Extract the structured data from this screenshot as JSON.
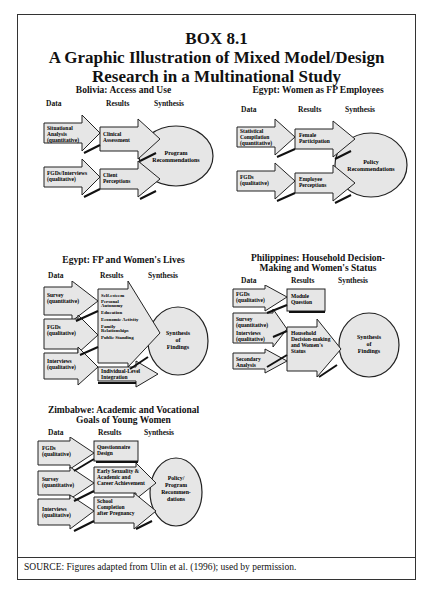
{
  "title": {
    "line1": "BOX 8.1",
    "line2": "A Graphic Illustration of Mixed Model/Design",
    "line3": "Research in a Multinational Study"
  },
  "columns": {
    "data": "Data",
    "results": "Results",
    "synthesis": "Synthesis"
  },
  "panels": [
    {
      "title_lines": [
        "Bolivia: Access and Use"
      ],
      "data": [
        [
          "Situational",
          "Analysis",
          "(quantitative)"
        ],
        [
          "FGDs/Interviews",
          "(qualitative)"
        ]
      ],
      "results": [
        [
          "Clinical",
          "Assessment"
        ],
        [
          "Client",
          "Perceptions"
        ]
      ],
      "synthesis": [
        "Program",
        "Recommendations"
      ]
    },
    {
      "title_lines": [
        "Egypt: Women as FP Employees"
      ],
      "data": [
        [
          "Statistical",
          "Compilation",
          "(quantitative)"
        ],
        [
          "FGDs",
          "(qualitative)"
        ]
      ],
      "results": [
        [
          "Female",
          "Participation"
        ],
        [
          "Employee",
          "Perceptions"
        ]
      ],
      "synthesis": [
        "Policy",
        "Recommendations"
      ]
    },
    {
      "title_lines": [
        "Egypt: FP and Women's Lives"
      ],
      "data": [
        [
          "Survey",
          "(quantitative)"
        ],
        [
          "FGDs",
          "(qualitative)"
        ],
        [
          "Interviews",
          "(qualitative)"
        ]
      ],
      "results": [
        [
          "Self-esteem",
          "Personal",
          "Autonomy",
          "Education",
          "Economic Activity",
          "Family",
          "Relationships",
          "Public Standing"
        ],
        [
          "Individual-Level",
          "Integration"
        ]
      ],
      "synthesis": [
        "Synthesis",
        "of",
        "Findings"
      ]
    },
    {
      "title_lines": [
        "Philippines: Household Decision-",
        "Making and Women's Status"
      ],
      "data": [
        [
          "FGDs",
          "(qualitative)"
        ],
        [
          "Survey",
          "(quantitative)",
          "Interviews",
          "(qualitative)"
        ],
        [
          "Secondary",
          "Analysis"
        ]
      ],
      "results": [
        [
          "Module",
          "Question"
        ],
        [
          "Household",
          "Decision-making",
          "and Women's",
          "Status"
        ]
      ],
      "synthesis": [
        "Synthesis",
        "of",
        "Findings"
      ]
    },
    {
      "title_lines": [
        "Zimbabwe: Academic and Vocational",
        "Goals of Young Women"
      ],
      "data": [
        [
          "FGDs",
          "(qualitative)"
        ],
        [
          "Survey",
          "(quantitative)"
        ],
        [
          "Interviews",
          "(qualitative)"
        ]
      ],
      "results": [
        [
          "Questionnaire",
          "Design"
        ],
        [
          "Early Sexuality &",
          "Academic and",
          "Career Achievement"
        ],
        [
          "School",
          "Completion",
          "after Pregnancy"
        ]
      ],
      "synthesis": [
        "Policy/",
        "Program",
        "Recommen-",
        "dations"
      ]
    }
  ],
  "source": "SOURCE: Figures adapted from Ulin et al. (1996); used by permission.",
  "colors": {
    "fill": "#e6e6e6",
    "stroke": "#222222",
    "shadow": "#1a1a1a"
  }
}
